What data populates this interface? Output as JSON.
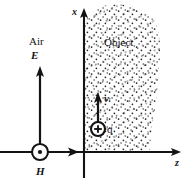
{
  "figure": {
    "background_color": "#ffffff",
    "ink_color": "#131313",
    "width": 191,
    "height": 188
  },
  "axes": {
    "vertical": {
      "name": "x",
      "icon": "axis-arrow-up-icon",
      "x_px": 84,
      "from_y_px": 178,
      "to_y_px": 8
    },
    "horizontal": {
      "name": "z",
      "icon": "axis-arrow-right-icon",
      "y_px": 152,
      "from_x_px": 0,
      "to_x_px": 181
    }
  },
  "regions": {
    "air": {
      "label": "Air",
      "description": "blank region left of the x axis"
    },
    "object": {
      "label": "Object",
      "description": "stippled region in the first quadrant, right of the x axis and above the z axis",
      "fill": "stipple-dots"
    }
  },
  "vectors": {
    "electric_field": {
      "label": "E",
      "icon": "vector-arrow-up-icon",
      "direction": "up",
      "tail_px": [
        40,
        150
      ],
      "tip_px": [
        40,
        66
      ]
    },
    "propagation": {
      "label": "",
      "icon": "vector-arrow-right-icon",
      "direction": "right",
      "tail_px": [
        40,
        152
      ],
      "tip_px": [
        79,
        152
      ]
    },
    "velocity": {
      "label": "v",
      "icon": "vector-arrow-up-icon",
      "direction": "up",
      "tail_px": [
        98,
        121
      ],
      "tip_px": [
        98,
        92
      ]
    }
  },
  "markers": {
    "magnetic_field": {
      "label": "H",
      "icon": "circle-dot-out-of-page-icon",
      "meaning": "field directed out of the page",
      "center_px": [
        40,
        152
      ],
      "radius_px": 8
    },
    "charge": {
      "label": "q",
      "icon": "circle-plus-charge-icon",
      "meaning": "positive point charge",
      "center_px": [
        98,
        129
      ],
      "radius_px": 7
    }
  }
}
